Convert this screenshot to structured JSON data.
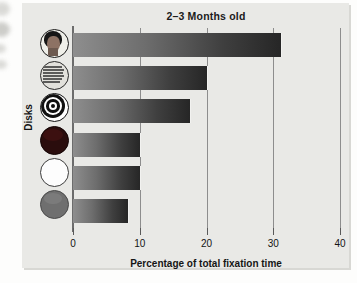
{
  "figure": {
    "title": "2–3 Months old",
    "ylabel": "Disks",
    "xlabel": "Percentage of total fixation time",
    "plot_background": "#e9e9e6",
    "bar_color_start": "#8e8e8e",
    "bar_color_end": "#262626",
    "axis_color": "#6c6c6c",
    "grid_color": "#8d8d8d"
  },
  "axis": {
    "ticks": [
      {
        "label": "0",
        "value": 0
      },
      {
        "label": "10",
        "value": 10
      },
      {
        "label": "20",
        "value": 20
      },
      {
        "label": "30",
        "value": 30
      },
      {
        "label": "40",
        "value": 40
      }
    ]
  },
  "disks": [
    {
      "name": "face-disk",
      "description": "Schematic human face photograph on a disk"
    },
    {
      "name": "print-disk",
      "description": "Disk covered with printed newsprint text"
    },
    {
      "name": "bullseye-disk",
      "description": "Concentric black and white rings (bullseye)"
    },
    {
      "name": "red-disk",
      "description": "Solid dark red disk"
    },
    {
      "name": "white-disk",
      "description": "Solid white disk"
    },
    {
      "name": "gray-disk",
      "description": "Solid gray disk"
    }
  ],
  "chart_data": {
    "type": "bar",
    "orientation": "horizontal",
    "title": "2–3 Months old",
    "xlabel": "Percentage of total fixation time",
    "ylabel": "Disks",
    "categories": [
      "Face",
      "Printed text",
      "Bullseye",
      "Red",
      "White",
      "Yellow/Gray"
    ],
    "values": [
      31.2,
      20.0,
      17.5,
      10.0,
      10.0,
      8.2
    ],
    "xlim": [
      0,
      40
    ],
    "xticks": [
      0,
      10,
      20,
      30,
      40
    ],
    "grid": true,
    "legend": "none",
    "units": "percent"
  }
}
